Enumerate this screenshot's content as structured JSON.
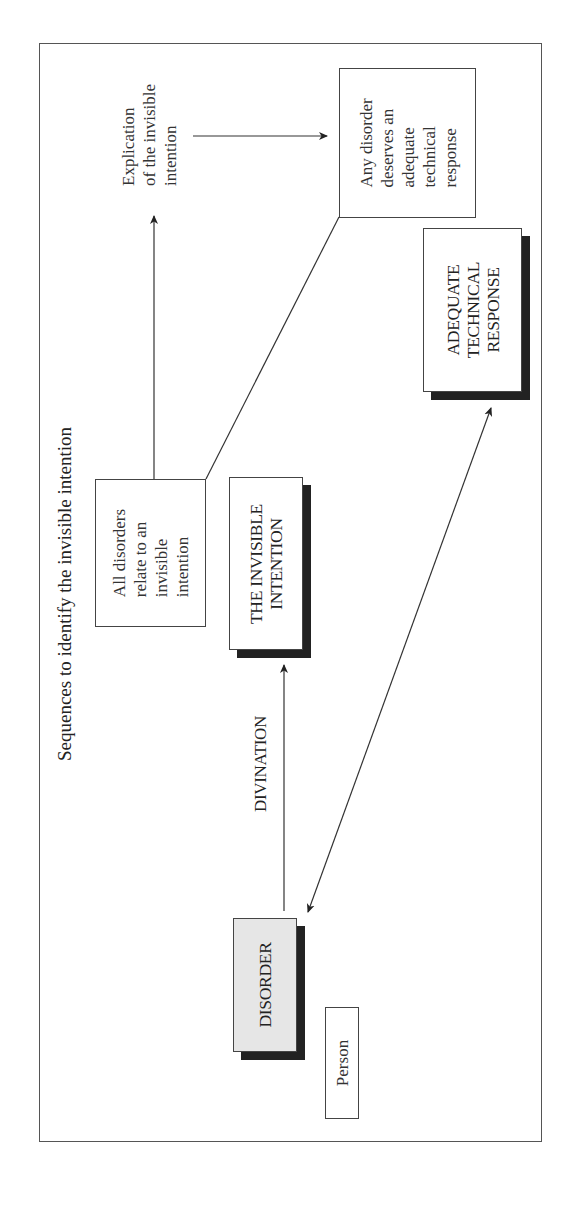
{
  "diagram": {
    "title": "Sequences to identify the invisible intention",
    "nodes": {
      "explication": {
        "lines": [
          "Explication",
          "of the invisible",
          "intention"
        ]
      },
      "any_disorder": {
        "lines": [
          "Any disorder",
          "deserves an",
          "adequate",
          "technical",
          "response"
        ]
      },
      "adequate_response": {
        "lines": [
          "ADEQUATE",
          "TECHNICAL",
          "RESPONSE"
        ]
      },
      "all_disorders": {
        "lines": [
          "All disorders",
          "relate to an",
          "invisible",
          "intention"
        ]
      },
      "invisible_intention": {
        "lines": [
          "THE INVISIBLE",
          "INTENTION"
        ]
      },
      "disorder": {
        "lines": [
          "DISORDER"
        ]
      },
      "person": {
        "lines": [
          "Person"
        ]
      }
    },
    "edge_labels": {
      "divination": "DIVINATION"
    },
    "edges": [
      {
        "from": "disorder",
        "to": "invisible_intention",
        "label": "DIVINATION",
        "type": "arrow"
      },
      {
        "from": "all_disorders",
        "to": "explication",
        "type": "arrow"
      },
      {
        "from": "explication",
        "to": "any_disorder",
        "type": "arrow"
      },
      {
        "from": "all_disorders",
        "to": "any_disorder",
        "type": "line"
      },
      {
        "from": "disorder",
        "to": "adequate_response",
        "type": "double-arrow"
      }
    ],
    "colors": {
      "disorder_fill": "#e6e6e6",
      "shadow": "#222222",
      "border": "#444444"
    }
  }
}
